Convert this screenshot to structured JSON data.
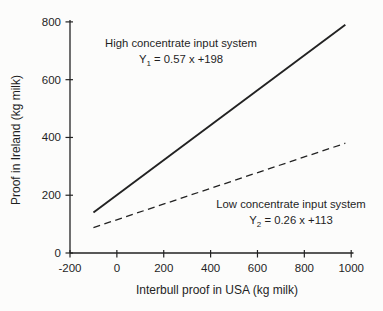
{
  "figure": {
    "background": "#fcfcfb",
    "ink": "#1f1f1f",
    "line_color": "#222222"
  },
  "chart_data": {
    "type": "line",
    "title": "",
    "xlabel": "Interbull proof in USA (kg milk)",
    "ylabel": "Proof in Ireland (kg milk)",
    "xlim": [
      -200,
      1000
    ],
    "ylim": [
      0,
      800
    ],
    "x_ticks": [
      -200,
      0,
      200,
      400,
      600,
      800,
      1000
    ],
    "y_ticks": [
      0,
      200,
      400,
      600,
      800
    ],
    "grid": false,
    "legend_position": "inline-annotations",
    "series": [
      {
        "name": "High concentrate input system",
        "line_style": "solid",
        "slope": 0.57,
        "intercept": 198,
        "equation": {
          "var": "Y",
          "sub": "1",
          "rhs": "= 0.57 x +198"
        },
        "points": [
          [
            -100,
            140
          ],
          [
            975,
            790
          ]
        ]
      },
      {
        "name": "Low concentrate input system",
        "line_style": "dashed",
        "slope": 0.26,
        "intercept": 113,
        "equation": {
          "var": "Y",
          "sub": "2",
          "rhs": "= 0.26 x +113"
        },
        "points": [
          [
            -100,
            88
          ],
          [
            975,
            380
          ]
        ]
      }
    ]
  }
}
